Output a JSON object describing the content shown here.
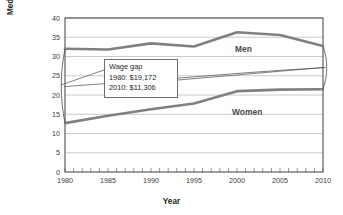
{
  "chart_data": {
    "type": "line",
    "title": "",
    "xlabel": "Year",
    "ylabel": "Median income in thousands\nof 2010 dollars",
    "xlim": [
      1980,
      2010
    ],
    "ylim": [
      0,
      40
    ],
    "yticks": [
      0,
      5,
      10,
      15,
      20,
      25,
      30,
      35,
      40
    ],
    "xticks": [
      1980,
      1985,
      1990,
      1995,
      2000,
      2005,
      2010
    ],
    "minor_xtick_interval": 1,
    "grid": "horizontal",
    "legend_position": "inline-labels",
    "x": [
      1980,
      1985,
      1990,
      1995,
      2000,
      2005,
      2010
    ],
    "series": [
      {
        "name": "Men",
        "color": "#808080",
        "line_width": 2.6,
        "label_position": {
          "x": 2002,
          "y": 34.0
        },
        "values": [
          32.0,
          31.8,
          33.4,
          32.6,
          36.3,
          35.6,
          32.7
        ]
      },
      {
        "name": "Women",
        "color": "#808080",
        "line_width": 2.6,
        "label_position": {
          "x": 2001.5,
          "y": 19.4
        },
        "values": [
          12.7,
          14.6,
          16.3,
          17.8,
          21.0,
          21.4,
          21.5
        ]
      },
      {
        "name": "Wage gap midline",
        "color": "#4a4a4a",
        "line_width": 0.7,
        "values": [
          22.2,
          23.0,
          23.9,
          24.7,
          25.6,
          26.4,
          27.1
        ]
      }
    ],
    "annotations": {
      "callout": {
        "title": "Wage gap",
        "rows": [
          {
            "label": "1980:",
            "value": "$19,172",
            "text": "1980: $19,172"
          },
          {
            "label": "2010:",
            "value": "$11,306",
            "text": "2010: $11,306"
          }
        ]
      },
      "brackets": [
        {
          "year": 1980,
          "top": 32.0,
          "bottom": 12.7
        },
        {
          "year": 2010,
          "top": 32.7,
          "bottom": 21.5
        }
      ]
    },
    "colors": {
      "plot_border": "#3f3f3f",
      "gridline": "#bdbdbd",
      "series": "#808080",
      "text": "#231f20",
      "background": "#ffffff"
    }
  }
}
